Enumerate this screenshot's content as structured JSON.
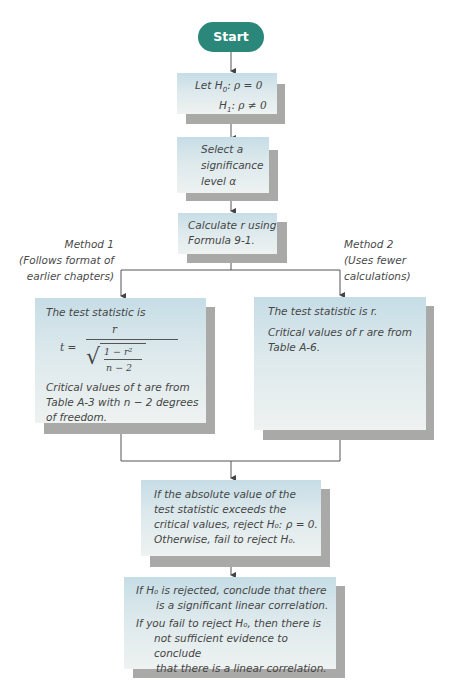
{
  "start": {
    "label": "Start"
  },
  "hypotheses": {
    "line1_prefix": "Let H",
    "line1_sub": "0",
    "line1_rest": ": ρ = 0",
    "line2_prefix": "H",
    "line2_sub": "1",
    "line2_rest": ": ρ ≠ 0"
  },
  "significance": {
    "line1": "Select a",
    "line2": "significance",
    "line3": "level α"
  },
  "calculate": {
    "line1": "Calculate r using",
    "line2": "Formula 9-1."
  },
  "method1": {
    "title": "Method 1",
    "line2": "(Follows format of",
    "line3": "earlier chapters)",
    "box": {
      "intro": "The test statistic is",
      "formula_lhs": "t =",
      "formula_num": "r",
      "formula_den_top": "1 − r²",
      "formula_den_bottom": "n − 2",
      "crit1": "Critical values of t are from",
      "crit2": "Table A-3 with n − 2 degrees",
      "crit3": "of freedom."
    }
  },
  "method2": {
    "title": "Method 2",
    "line2": "(Uses fewer",
    "line3": "calculations)",
    "box": {
      "intro": "The test statistic is r.",
      "crit1": "Critical values of r are from",
      "crit2": "Table A-6."
    }
  },
  "decision": {
    "line1": "If the absolute value of the",
    "line2": "test statistic exceeds the",
    "line3": "critical values, reject H₀: ρ = 0.",
    "line4": "Otherwise, fail to reject H₀."
  },
  "conclusion": {
    "line1": "If H₀ is rejected, conclude that there",
    "line2": "is a significant linear correlation.",
    "line3": "If you fail to reject H₀, then there is",
    "line4": "not sufficient evidence to conclude",
    "line5": "that there is a linear correlation."
  },
  "colors": {
    "start_fill": "#2b8779",
    "box_top": "#c6dde6",
    "box_bottom": "#eef2f1",
    "shadow": "#a9a9a7",
    "line": "#555555"
  }
}
